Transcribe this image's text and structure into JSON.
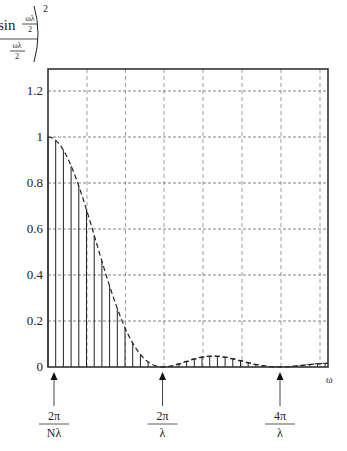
{
  "formula": {
    "func": "sin",
    "inner_num": "ωλ",
    "inner_den": "2",
    "outer_num": "ωλ",
    "outer_den": "2",
    "exponent": "2"
  },
  "chart_data": {
    "type": "line",
    "xlabel": "ω",
    "ylabel": "",
    "ylim": [
      0,
      1.3
    ],
    "yticks": [
      0,
      0.2,
      0.4,
      0.6,
      0.8,
      1,
      1.2
    ],
    "ytick_labels": [
      "0",
      "0.2",
      "0.4",
      "0.6",
      "0.8",
      "1",
      "1.2"
    ],
    "grid": true,
    "grid_style": "dashed",
    "x_annotations": [
      {
        "num": "2π",
        "den": "Nλ",
        "x_units_of_2pi_over_lambda": 0.0667
      },
      {
        "num": "2π",
        "den": "λ",
        "x_units_of_2pi_over_lambda": 1
      },
      {
        "num": "4π",
        "den": "λ",
        "x_units_of_2pi_over_lambda": 2
      }
    ],
    "series": [
      {
        "name": "envelope (sinc²)",
        "style": "dashed",
        "function": "(sin(ωλ/2)/(ωλ/2))^2"
      },
      {
        "name": "sampled spectrum",
        "style": "stems",
        "spacing": "2π/(Nλ)",
        "N": 15
      }
    ],
    "x_range_in_units_of_2pi_over_lambda": [
      0,
      2.41
    ],
    "key_points": [
      {
        "x": 0,
        "y": 1.0
      },
      {
        "x": "2π/λ",
        "y": 0
      },
      {
        "x": "3π/λ",
        "y": 0.045
      },
      {
        "x": "4π/λ",
        "y": 0
      }
    ]
  },
  "axis": {
    "x_symbol": "ω"
  }
}
